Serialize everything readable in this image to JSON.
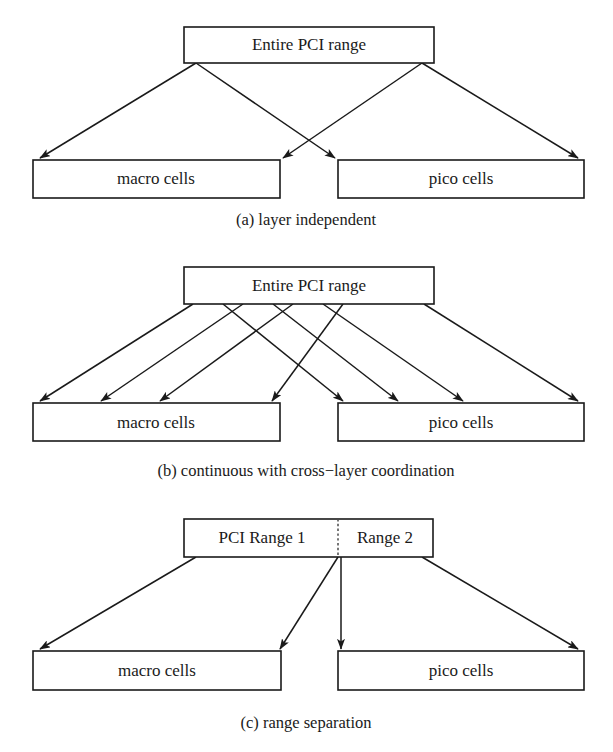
{
  "figure": {
    "width": 613,
    "height": 752,
    "background": "#ffffff",
    "stroke_color": "#1a1a1a",
    "text_color": "#1a1a1a",
    "dotted_divider_color": "#4a4a4a"
  },
  "panels": [
    {
      "id": "panel-a",
      "caption": "(a) layer independent",
      "caption_pos": {
        "x": 306,
        "y": 221
      },
      "top_box": {
        "label": "Entire PCI range",
        "x": 184,
        "y": 27,
        "w": 250,
        "h": 36,
        "label_x": 309,
        "label_y": 46
      },
      "bottom_boxes": [
        {
          "label": "macro cells",
          "x": 33,
          "y": 160,
          "w": 247,
          "h": 38,
          "label_x": 156,
          "label_y": 180
        },
        {
          "label": "pico cells",
          "x": 338,
          "y": 160,
          "w": 246,
          "h": 38,
          "label_x": 461,
          "label_y": 180
        }
      ],
      "arrows": [
        {
          "name": "arrow-range-to-macro-outer",
          "x1": 196,
          "y1": 63,
          "x2": 40,
          "y2": 158
        },
        {
          "name": "arrow-range-to-macro-inner",
          "x1": 422,
          "y1": 63,
          "x2": 283,
          "y2": 158
        },
        {
          "name": "arrow-range-to-pico-inner",
          "x1": 196,
          "y1": 63,
          "x2": 335,
          "y2": 158
        },
        {
          "name": "arrow-range-to-pico-outer",
          "x1": 422,
          "y1": 63,
          "x2": 578,
          "y2": 158
        }
      ],
      "dotted_divider": null
    },
    {
      "id": "panel-b",
      "caption": "(b) continuous with cross−layer coordination",
      "caption_pos": {
        "x": 306,
        "y": 472
      },
      "top_box": {
        "label": "Entire PCI range",
        "x": 184,
        "y": 267,
        "w": 250,
        "h": 37,
        "label_x": 309,
        "label_y": 287
      },
      "bottom_boxes": [
        {
          "label": "macro cells",
          "x": 33,
          "y": 403,
          "w": 247,
          "h": 38,
          "label_x": 156,
          "label_y": 424
        },
        {
          "label": "pico cells",
          "x": 338,
          "y": 403,
          "w": 246,
          "h": 38,
          "label_x": 461,
          "label_y": 424
        }
      ],
      "arrows": [
        {
          "name": "arrow-b-1-macro",
          "x1": 193,
          "y1": 304,
          "x2": 40,
          "y2": 401
        },
        {
          "name": "arrow-b-2-macro",
          "x1": 243,
          "y1": 304,
          "x2": 101,
          "y2": 401
        },
        {
          "name": "arrow-b-3-macro",
          "x1": 293,
          "y1": 304,
          "x2": 160,
          "y2": 401
        },
        {
          "name": "arrow-b-4-macro",
          "x1": 343,
          "y1": 304,
          "x2": 272,
          "y2": 401
        },
        {
          "name": "arrow-b-5-pico",
          "x1": 223,
          "y1": 304,
          "x2": 343,
          "y2": 401
        },
        {
          "name": "arrow-b-6-pico",
          "x1": 273,
          "y1": 304,
          "x2": 398,
          "y2": 401
        },
        {
          "name": "arrow-b-7-pico",
          "x1": 323,
          "y1": 304,
          "x2": 463,
          "y2": 401
        },
        {
          "name": "arrow-b-8-pico",
          "x1": 424,
          "y1": 304,
          "x2": 578,
          "y2": 401
        }
      ],
      "dotted_divider": null
    },
    {
      "id": "panel-c",
      "caption": "(c) range separation",
      "caption_pos": {
        "x": 306,
        "y": 724
      },
      "top_box": {
        "label": "PCI Range 1",
        "x": 184,
        "y": 519,
        "w": 249,
        "h": 38,
        "label_x": 262,
        "label_y": 539
      },
      "top_box_right_label": {
        "label": "Range 2",
        "label_x": 385,
        "label_y": 539
      },
      "bottom_boxes": [
        {
          "label": "macro cells",
          "x": 33,
          "y": 651,
          "w": 248,
          "h": 39,
          "label_x": 157,
          "label_y": 672
        },
        {
          "label": "pico cells",
          "x": 338,
          "y": 651,
          "w": 246,
          "h": 39,
          "label_x": 461,
          "label_y": 672
        }
      ],
      "arrows": [
        {
          "name": "arrow-c-range1-to-macro-outer",
          "x1": 196,
          "y1": 557,
          "x2": 40,
          "y2": 649
        },
        {
          "name": "arrow-c-range1-to-macro-inner",
          "x1": 338,
          "y1": 557,
          "x2": 280,
          "y2": 649
        },
        {
          "name": "arrow-c-range2-to-pico-inner",
          "x1": 341,
          "y1": 557,
          "x2": 341,
          "y2": 649
        },
        {
          "name": "arrow-c-range2-to-pico-outer",
          "x1": 422,
          "y1": 557,
          "x2": 578,
          "y2": 649
        }
      ],
      "dotted_divider": {
        "x": 338,
        "y1": 519,
        "y2": 557
      }
    }
  ]
}
